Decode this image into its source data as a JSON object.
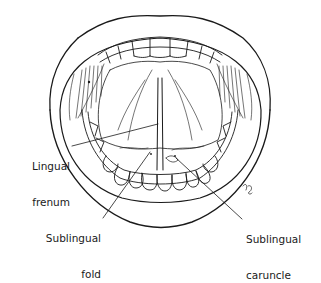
{
  "diagram": {
    "line_color": "#1a1a1a",
    "background": "#ffffff",
    "labels": [
      {
        "id": "lingual-frenum",
        "line1": "Lingual",
        "line2": "frenum"
      },
      {
        "id": "sublingual-fold",
        "line1": "Sublingual",
        "line2": "fold"
      },
      {
        "id": "sublingual-caruncle",
        "line1": "Sublingual",
        "line2": "caruncle"
      }
    ],
    "signature": "kg"
  }
}
